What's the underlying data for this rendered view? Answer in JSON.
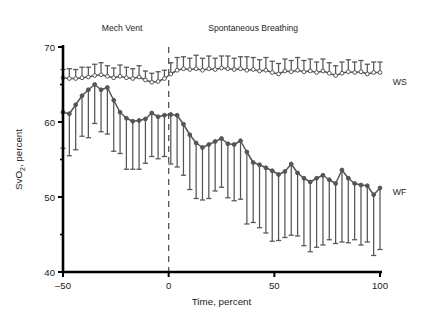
{
  "chart_data": {
    "type": "line",
    "title": "",
    "xlabel": "Time, percent",
    "ylabel": "SvO2, percent",
    "ylabel_main": "SvO",
    "ylabel_sub": "2",
    "ylabel_tail": ", percent",
    "xlim": [
      -52,
      102
    ],
    "ylim": [
      40,
      70
    ],
    "xticks": [
      -50,
      0,
      50,
      100
    ],
    "xticklabels": [
      "–50",
      "0",
      "50",
      "100"
    ],
    "yticks": [
      40,
      50,
      60,
      70
    ],
    "yticklabels": [
      "40",
      "50",
      "60",
      "70"
    ],
    "yminorticks": [
      45,
      55,
      65
    ],
    "grid": false,
    "legend_position": "right-inline",
    "annotations": [
      {
        "name": "mech-vent-label",
        "text": "Mech Vent",
        "x": -22,
        "y": 72.2
      },
      {
        "name": "spontaneous-breathing-label",
        "text": "Spontaneous Breathing",
        "x": 40,
        "y": 72.2
      }
    ],
    "vline": {
      "x": 0,
      "style": "dashed",
      "color": "#555555"
    },
    "series": [
      {
        "name": "WS",
        "label": "WS",
        "marker": "open-circle",
        "color": "#555555",
        "errorbar_direction": "up",
        "label_x": 106,
        "label_y": 65.4,
        "x": [
          -50,
          -47,
          -44,
          -41,
          -38,
          -35,
          -32,
          -29,
          -26,
          -23,
          -20,
          -17,
          -14,
          -11,
          -8,
          -5,
          -2,
          1,
          4,
          7,
          10,
          13,
          16,
          19,
          22,
          25,
          28,
          31,
          34,
          37,
          40,
          43,
          46,
          49,
          52,
          55,
          58,
          61,
          64,
          67,
          70,
          73,
          76,
          79,
          82,
          85,
          88,
          91,
          94,
          97,
          100
        ],
        "y": [
          65.9,
          65.8,
          65.8,
          65.9,
          66.0,
          66.2,
          66.3,
          66.1,
          65.9,
          66.1,
          65.9,
          65.8,
          66.0,
          65.6,
          65.3,
          65.4,
          65.8,
          66.4,
          66.9,
          67.1,
          67.0,
          67.1,
          66.9,
          67.1,
          67.0,
          67.2,
          67.1,
          67.0,
          67.1,
          66.9,
          67.0,
          66.8,
          66.9,
          66.6,
          66.4,
          66.8,
          66.7,
          66.9,
          66.7,
          66.8,
          66.6,
          66.8,
          66.5,
          66.2,
          66.5,
          66.7,
          66.6,
          66.7,
          66.4,
          66.6,
          66.6
        ],
        "err": [
          1.1,
          1.3,
          1.2,
          1.4,
          1.3,
          1.5,
          1.6,
          1.4,
          1.3,
          1.5,
          1.4,
          1.3,
          1.5,
          1.2,
          1.2,
          1.3,
          1.1,
          1.5,
          1.7,
          1.6,
          1.5,
          1.8,
          1.6,
          1.7,
          1.5,
          1.6,
          1.7,
          1.5,
          1.6,
          1.8,
          1.6,
          1.5,
          1.7,
          1.5,
          1.4,
          1.6,
          1.5,
          1.7,
          1.5,
          1.6,
          1.4,
          1.6,
          1.4,
          1.3,
          1.5,
          1.6,
          1.4,
          1.5,
          1.3,
          1.4,
          1.4
        ]
      },
      {
        "name": "WF",
        "label": "WF",
        "marker": "filled-circle",
        "color": "#555555",
        "errorbar_direction": "down",
        "label_x": 106,
        "label_y": 50.7,
        "x": [
          -50,
          -47,
          -44,
          -41,
          -38,
          -35,
          -32,
          -29,
          -26,
          -23,
          -20,
          -17,
          -14,
          -11,
          -8,
          -5,
          -2,
          1,
          4,
          7,
          10,
          13,
          16,
          19,
          22,
          25,
          28,
          31,
          34,
          37,
          40,
          43,
          46,
          49,
          52,
          55,
          58,
          61,
          64,
          67,
          70,
          73,
          76,
          79,
          82,
          85,
          88,
          91,
          94,
          97,
          100
        ],
        "y": [
          61.3,
          61.1,
          62.3,
          63.5,
          64.3,
          65.0,
          64.3,
          64.6,
          62.9,
          61.3,
          60.5,
          60.1,
          60.2,
          60.4,
          61.2,
          60.7,
          60.9,
          61.0,
          60.9,
          59.7,
          58.3,
          57.2,
          56.6,
          57.0,
          57.4,
          57.8,
          57.1,
          57.0,
          57.5,
          56.0,
          54.6,
          54.3,
          53.9,
          53.5,
          53.0,
          53.4,
          54.4,
          53.2,
          52.5,
          52.0,
          52.5,
          52.9,
          52.3,
          51.8,
          53.6,
          52.5,
          51.8,
          51.6,
          51.5,
          50.3,
          51.2
        ],
        "err": [
          4.8,
          5.6,
          6.0,
          5.4,
          6.4,
          5.2,
          5.6,
          6.2,
          6.8,
          5.5,
          6.8,
          6.4,
          6.5,
          5.9,
          5.8,
          5.6,
          5.5,
          6.6,
          6.9,
          6.8,
          7.3,
          7.4,
          7.0,
          7.2,
          6.6,
          6.5,
          7.2,
          7.5,
          7.8,
          9.6,
          8.0,
          8.4,
          8.7,
          9.4,
          8.8,
          8.8,
          9.5,
          8.4,
          9.0,
          9.3,
          9.2,
          9.3,
          8.0,
          8.0,
          9.6,
          8.6,
          7.5,
          8.0,
          7.5,
          8.1,
          8.2
        ]
      }
    ]
  }
}
